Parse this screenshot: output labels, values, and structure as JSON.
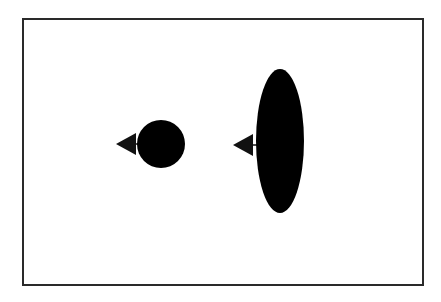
{
  "diagram": {
    "frame": {
      "stroke": "#2a2a2a"
    },
    "shapes": [
      {
        "id": "circle",
        "type": "circle",
        "cx": 161,
        "cy": 144,
        "r": 24,
        "fill": "#000000",
        "marker": {
          "type": "triangle-left",
          "tip_x": 116,
          "base_x": 136,
          "cy": 144,
          "half_height": 11
        }
      },
      {
        "id": "ellipse",
        "type": "ellipse",
        "cx": 280,
        "cy": 141,
        "rx": 24,
        "ry": 72,
        "fill": "#000000",
        "marker": {
          "type": "triangle-left",
          "tip_x": 233,
          "base_x": 253,
          "cy": 145,
          "half_height": 11
        }
      }
    ],
    "labels": []
  }
}
